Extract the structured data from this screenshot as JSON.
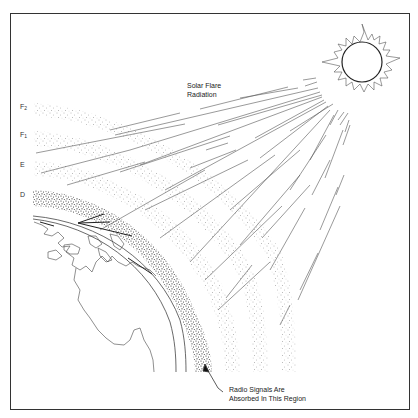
{
  "diagram": {
    "title_label": {
      "line1": "Solar Flare",
      "line2": "Radiation"
    },
    "layers": [
      {
        "id": "F2",
        "base": "F",
        "sub": "2"
      },
      {
        "id": "F1",
        "base": "F",
        "sub": "1"
      },
      {
        "id": "E",
        "base": "E",
        "sub": ""
      },
      {
        "id": "D",
        "base": "D",
        "sub": ""
      }
    ],
    "callout": {
      "line1": "Radio Signals Are",
      "line2": "Absorbed In This Region"
    },
    "colors": {
      "line": "#555555",
      "frame": "#333333",
      "dots": "#444444",
      "background": "#ffffff"
    }
  }
}
